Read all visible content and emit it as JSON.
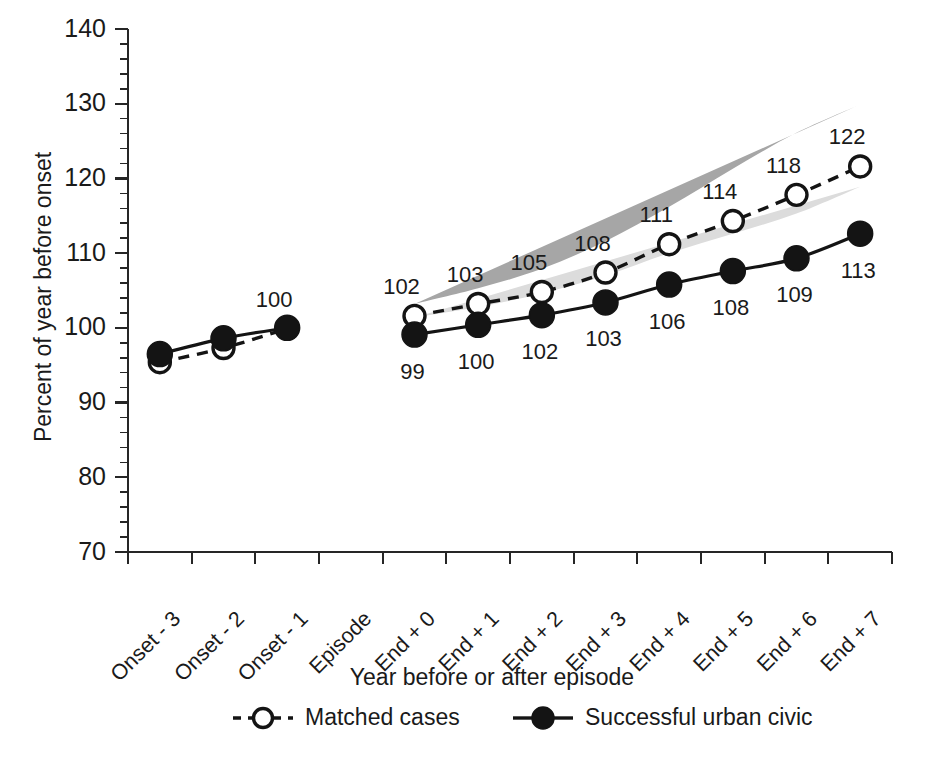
{
  "chart_data": {
    "type": "line",
    "title": "",
    "xlabel": "Year before or after episode",
    "ylabel": "Percent of year before onset",
    "ylim": [
      70,
      140
    ],
    "y_major_step": 10,
    "y_minor_step": 2,
    "grid": false,
    "legend_position": "bottom",
    "categories": [
      "Onset - 3",
      "Onset - 2",
      "Onset - 1",
      "Episode",
      "End + 0",
      "End + 1",
      "End + 2",
      "End + 3",
      "End + 4",
      "End + 5",
      "End + 6",
      "End + 7"
    ],
    "ytick_labels": [
      "70",
      "80",
      "90",
      "100",
      "110",
      "120",
      "130",
      "140"
    ],
    "ytick_values": [
      70,
      80,
      90,
      100,
      110,
      120,
      130,
      140
    ],
    "series": [
      {
        "name": "Matched cases",
        "style": "dashed",
        "marker": "open-circle",
        "label_position": "above",
        "x": [
          "Onset - 3",
          "Onset - 2",
          "Onset - 1",
          "End + 0",
          "End + 1",
          "End + 2",
          "End + 3",
          "End + 4",
          "End + 5",
          "End + 6",
          "End + 7"
        ],
        "values": [
          95.4,
          97.3,
          99.9,
          101.6,
          103.2,
          104.8,
          107.4,
          111.2,
          114.3,
          117.8,
          121.6
        ],
        "point_labels": [
          "",
          "",
          "100",
          "102",
          "103",
          "105",
          "108",
          "111",
          "114",
          "118",
          "122"
        ]
      },
      {
        "name": "Successful urban civic",
        "style": "solid",
        "marker": "filled-circle",
        "label_position": "below",
        "x": [
          "Onset - 3",
          "Onset - 2",
          "Onset - 1",
          "End + 0",
          "End + 1",
          "End + 2",
          "End + 3",
          "End + 4",
          "End + 5",
          "End + 6",
          "End + 7"
        ],
        "values": [
          96.5,
          98.6,
          100.0,
          99.1,
          100.4,
          101.7,
          103.4,
          105.8,
          107.6,
          109.3,
          112.6
        ],
        "point_labels": [
          "",
          "",
          "",
          "99",
          "100",
          "102",
          "103",
          "106",
          "108",
          "109",
          "113"
        ]
      }
    ],
    "bands": [
      {
        "name": "Matched cases confidence band",
        "color": "#a6a6a6",
        "x": [
          "End + 0",
          "End + 1",
          "End + 2",
          "End + 3",
          "End + 4",
          "End + 5",
          "End + 6",
          "End + 7"
        ],
        "upper": [
          103.2,
          105.3,
          107.9,
          111.6,
          116.2,
          121.3,
          126.1,
          129.9
        ],
        "lower": [
          100.4,
          101.6,
          103.0,
          105.4,
          108.3,
          110.8,
          113.4,
          116.2
        ]
      },
      {
        "name": "Successful urban civic confidence band",
        "color": "#dcdcdc",
        "x": [
          "End + 0",
          "End + 1",
          "End + 2",
          "End + 3",
          "End + 4",
          "End + 5",
          "End + 6",
          "End + 7"
        ],
        "upper": [
          101.4,
          102.8,
          104.6,
          107.0,
          110.0,
          112.6,
          115.3,
          118.9
        ],
        "lower": [
          98.1,
          99.0,
          100.0,
          101.2,
          102.8,
          104.0,
          105.2,
          107.2
        ]
      }
    ]
  },
  "legend": {
    "items": [
      {
        "label": "Matched cases",
        "style": "dashed",
        "marker": "open-circle"
      },
      {
        "label": "Successful urban civic",
        "style": "solid",
        "marker": "filled-circle"
      }
    ]
  }
}
